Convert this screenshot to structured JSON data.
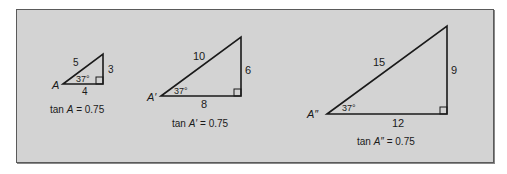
{
  "figure": {
    "background": "#d3d3d3",
    "stroke": "#1a1a1a",
    "triangles": [
      {
        "vertex_label": "A",
        "hypotenuse": "5",
        "opposite": "3",
        "adjacent": "4",
        "angle": "37°",
        "caption_prefix": "tan ",
        "caption_var": "A",
        "caption_suffix": " = 0.75"
      },
      {
        "vertex_label": "A′",
        "hypotenuse": "10",
        "opposite": "6",
        "adjacent": "8",
        "angle": "37°",
        "caption_prefix": "tan ",
        "caption_var": "A′",
        "caption_suffix": " = 0.75"
      },
      {
        "vertex_label": "A″",
        "hypotenuse": "15",
        "opposite": "9",
        "adjacent": "12",
        "angle": "37°",
        "caption_prefix": "tan ",
        "caption_var": "A″",
        "caption_suffix": " = 0.75"
      }
    ]
  }
}
